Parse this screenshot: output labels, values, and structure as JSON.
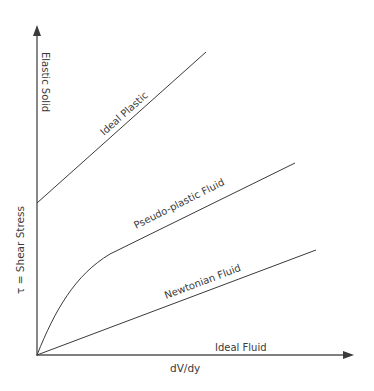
{
  "axes": {
    "x_label": "dV/dy",
    "y_label": "τ = Shear Stress"
  },
  "curves": [
    {
      "name": "Elastic Solid",
      "label": "Elastic Solid",
      "description": "vertical line along shear stress axis"
    },
    {
      "name": "Ideal Plastic",
      "label": "Ideal Plastic",
      "description": "straight line with yield stress intercept"
    },
    {
      "name": "Pseudo-plastic Fluid",
      "label": "Pseudo-plastic Fluid",
      "description": "concave-down curve from origin becoming linear"
    },
    {
      "name": "Newtonian Fluid",
      "label": "Newtonian Fluid",
      "description": "straight line through origin"
    },
    {
      "name": "Ideal Fluid",
      "label": "Ideal Fluid",
      "description": "horizontal line along dV/dy axis"
    }
  ],
  "colors": {
    "line": "#3a3a3a",
    "text": "#3a3a3a",
    "background": "#ffffff"
  }
}
